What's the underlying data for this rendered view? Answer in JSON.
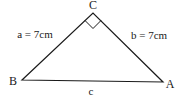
{
  "diagram": {
    "type": "right-triangle",
    "vertices": {
      "A": {
        "label": "A",
        "x": 163,
        "y": 82
      },
      "B": {
        "label": "B",
        "x": 22,
        "y": 80
      },
      "C": {
        "label": "C",
        "x": 93,
        "y": 13
      }
    },
    "right_angle_at": "C",
    "sides": {
      "a": {
        "label": "a = 7cm",
        "between": [
          "B",
          "C"
        ]
      },
      "b": {
        "label": "b = 7cm",
        "between": [
          "C",
          "A"
        ]
      },
      "c": {
        "label": "c",
        "between": [
          "B",
          "A"
        ]
      }
    },
    "colors": {
      "stroke": "#1a1a1a",
      "background": "#ffffff"
    }
  }
}
